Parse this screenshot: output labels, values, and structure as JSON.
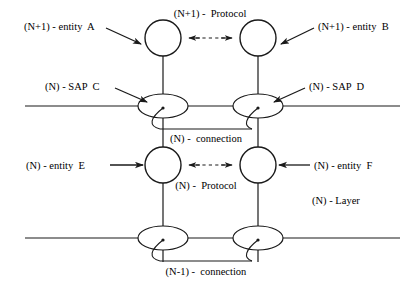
{
  "diagram": {
    "stroke_color": "#1a1a1a",
    "fill_color": "#ffffff",
    "background": "#ffffff",
    "labels": {
      "entity_a": "(N+1) - entity  A",
      "entity_b": "(N+1) - entity  B",
      "protocol_upper": "(N+1) -  Protocol",
      "sap_c": "(N) - SAP  C",
      "sap_d": "(N) - SAP  D",
      "connection_n": "(N) -  connection",
      "entity_e": "(N) - entity  E",
      "entity_f": "(N) - entity  F",
      "protocol_lower": "(N) -  Protocol",
      "layer_n": "(N) - Layer",
      "connection_n_minus_1": "(N-1) -  connection"
    },
    "nodes": [
      {
        "name": "entity-a-circle",
        "shape": "circle",
        "cx": 163,
        "cy": 38,
        "r": 18
      },
      {
        "name": "entity-b-circle",
        "shape": "circle",
        "cx": 258,
        "cy": 38,
        "r": 18
      },
      {
        "name": "entity-e-circle",
        "shape": "circle",
        "cx": 163,
        "cy": 165,
        "r": 18
      },
      {
        "name": "entity-f-circle",
        "shape": "circle",
        "cx": 258,
        "cy": 165,
        "r": 18
      },
      {
        "name": "sap-c-ellipse",
        "shape": "ellipse",
        "cx": 163,
        "cy": 106,
        "rx": 25,
        "ry": 12
      },
      {
        "name": "sap-d-ellipse",
        "shape": "ellipse",
        "cx": 258,
        "cy": 106,
        "rx": 25,
        "ry": 12
      },
      {
        "name": "sap-lower-left-ellipse",
        "shape": "ellipse",
        "cx": 163,
        "cy": 238,
        "rx": 25,
        "ry": 12
      },
      {
        "name": "sap-lower-right-ellipse",
        "shape": "ellipse",
        "cx": 258,
        "cy": 238,
        "rx": 25,
        "ry": 12
      }
    ],
    "boundaries": [
      {
        "name": "upper-layer-boundary",
        "y": 106,
        "x1": 25,
        "x2": 400
      },
      {
        "name": "lower-layer-boundary",
        "y": 238,
        "x1": 25,
        "x2": 400
      }
    ]
  }
}
